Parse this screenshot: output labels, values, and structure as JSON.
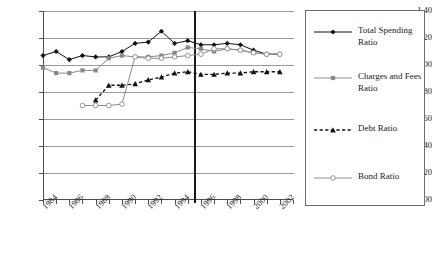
{
  "chart_data": {
    "type": "line",
    "title": "",
    "xlabel": "",
    "ylabel": "",
    "xlim": [
      1984,
      2003
    ],
    "ylim": [
      0.0,
      1.4
    ],
    "grid": true,
    "legend_position": "right",
    "y_ticks": [
      "0.00",
      "0.20",
      "0.40",
      "0.60",
      "0.80",
      "1.00",
      "1.20",
      "1.40"
    ],
    "y_tick_values": [
      0.0,
      0.2,
      0.4,
      0.6,
      0.8,
      1.0,
      1.2,
      1.4
    ],
    "x_tick_labels": [
      "1984",
      "1986",
      "1988",
      "1990",
      "1992",
      "1994",
      "1996",
      "1998",
      "2000",
      "2002"
    ],
    "x_tick_values": [
      1984,
      1986,
      1988,
      1990,
      1992,
      1994,
      1996,
      1998,
      2000,
      2002
    ],
    "x_minor_ticks": [
      1985,
      1987,
      1989,
      1991,
      1993,
      1995,
      1997,
      1999,
      2001,
      2003
    ],
    "annotations": [
      {
        "name": "vertical-reference-line",
        "type": "vline",
        "x": 1995.5,
        "color": "#1a1a1a"
      }
    ],
    "series": [
      {
        "name": "Total Spending Ratio",
        "color": "#111111",
        "marker": "diamond",
        "dash": "solid",
        "x": [
          1984,
          1985,
          1986,
          1987,
          1988,
          1989,
          1990,
          1991,
          1992,
          1993,
          1994,
          1995,
          1996,
          1997,
          1998,
          1999,
          2000,
          2001,
          2002
        ],
        "values": [
          1.07,
          1.1,
          1.04,
          1.07,
          1.06,
          1.06,
          1.1,
          1.16,
          1.17,
          1.25,
          1.16,
          1.18,
          1.15,
          1.15,
          1.16,
          1.15,
          1.11,
          1.08,
          1.08
        ]
      },
      {
        "name": "Charges and Fees Ratio",
        "color": "#8a8a8a",
        "marker": "square",
        "dash": "solid",
        "x": [
          1984,
          1985,
          1986,
          1987,
          1988,
          1989,
          1990,
          1991,
          1992,
          1993,
          1994,
          1995,
          1996,
          1997,
          1998,
          1999,
          2000,
          2001,
          2002
        ],
        "values": [
          0.98,
          0.94,
          0.94,
          0.96,
          0.96,
          1.05,
          1.07,
          1.06,
          1.06,
          1.07,
          1.09,
          1.13,
          1.12,
          1.1,
          1.12,
          1.11,
          1.09,
          1.08,
          1.08
        ]
      },
      {
        "name": "Debt Ratio",
        "color": "#111111",
        "marker": "triangle",
        "dash": "dashed",
        "x": [
          1988,
          1989,
          1990,
          1991,
          1992,
          1993,
          1994,
          1995,
          1996,
          1997,
          1998,
          1999,
          2000,
          2001,
          2002
        ],
        "values": [
          0.74,
          0.85,
          0.85,
          0.86,
          0.89,
          0.91,
          0.94,
          0.95,
          0.93,
          0.93,
          0.94,
          0.94,
          0.95,
          0.95,
          0.95
        ]
      },
      {
        "name": "Bond Ratio",
        "color": "#8a8a8a",
        "marker": "open-circle",
        "dash": "solid",
        "x": [
          1987,
          1988,
          1989,
          1990,
          1991,
          1992,
          1993,
          1994,
          1995,
          1996,
          1997,
          1998,
          1999,
          2000,
          2001,
          2002
        ],
        "values": [
          0.7,
          0.7,
          0.7,
          0.71,
          1.06,
          1.05,
          1.05,
          1.06,
          1.07,
          1.08,
          1.12,
          1.12,
          1.11,
          1.09,
          1.08,
          1.08
        ]
      }
    ]
  },
  "legend": {
    "items": [
      {
        "label": "Total Spending Ratio",
        "color": "#111111",
        "marker": "diamond",
        "dash": "solid"
      },
      {
        "label": "Charges and Fees Ratio",
        "color": "#8a8a8a",
        "marker": "square",
        "dash": "solid"
      },
      {
        "label": "Debt Ratio",
        "color": "#111111",
        "marker": "triangle",
        "dash": "dashed"
      },
      {
        "label": "Bond Ratio",
        "color": "#8a8a8a",
        "marker": "open-circle",
        "dash": "solid"
      }
    ]
  }
}
